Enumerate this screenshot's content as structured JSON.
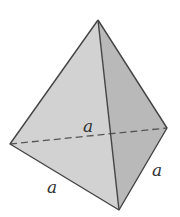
{
  "diagram": {
    "shape": "tetrahedron",
    "vertices": {
      "top": [
        98,
        20
      ],
      "left": [
        10,
        144
      ],
      "right": [
        167,
        128
      ],
      "bottom": [
        119,
        210
      ]
    },
    "labels": {
      "back_edge": "a",
      "left_bottom_edge": "a",
      "right_bottom_edge": "a"
    },
    "colors": {
      "left_face": "#d2d2d2",
      "right_face": "#b9b9b9",
      "edge": "#444444",
      "hidden_edge": "#555555",
      "label": "#333333"
    }
  }
}
